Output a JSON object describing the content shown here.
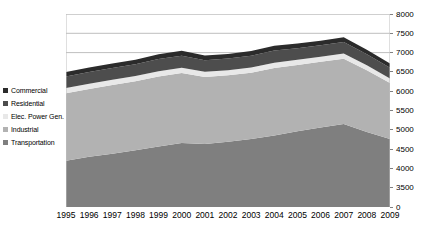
{
  "chart_data": {
    "type": "area",
    "stacked": true,
    "title": "",
    "xlabel": "",
    "ylabel": "",
    "grid": true,
    "legend_position": "left",
    "x": [
      "1995",
      "1996",
      "1997",
      "1998",
      "1999",
      "2000",
      "2001",
      "2002",
      "2003",
      "2004",
      "2005",
      "2006",
      "2007",
      "2008",
      "2009"
    ],
    "axis": {
      "y_tick_labels": [
        "8000",
        "7500",
        "7000",
        "6500",
        "6000",
        "5500",
        "5000",
        "4500",
        "4000",
        "3500",
        "0"
      ],
      "y_tick_values": [
        8000,
        7500,
        7000,
        6500,
        6000,
        5500,
        5000,
        4500,
        4000,
        3500,
        0
      ],
      "y_broken_axis": true,
      "y_min_display": 3200,
      "y_max_display": 8000,
      "gridline_values": [
        8000,
        7500,
        7000
      ]
    },
    "series": [
      {
        "name": "Transportation",
        "color": "#7f7f7f",
        "values": [
          4200,
          4300,
          4380,
          4470,
          4570,
          4660,
          4630,
          4690,
          4760,
          4850,
          4960,
          5060,
          5150,
          4940,
          4760
        ]
      },
      {
        "name": "Industrial",
        "color": "#b2b2b2",
        "values": [
          1750,
          1760,
          1780,
          1790,
          1810,
          1810,
          1740,
          1720,
          1720,
          1750,
          1720,
          1700,
          1690,
          1600,
          1450
        ]
      },
      {
        "name": "Elec. Power Gen.",
        "color": "#e8e8e8",
        "values": [
          130,
          130,
          135,
          135,
          140,
          140,
          135,
          135,
          135,
          140,
          135,
          135,
          135,
          130,
          120
        ]
      },
      {
        "name": "Residential",
        "color": "#4d4d4d",
        "values": [
          300,
          305,
          305,
          300,
          315,
          310,
          300,
          300,
          305,
          315,
          300,
          295,
          300,
          290,
          280
        ]
      },
      {
        "name": "Commercial",
        "color": "#2b2b2b",
        "values": [
          120,
          120,
          120,
          120,
          125,
          125,
          120,
          120,
          120,
          125,
          120,
          120,
          120,
          115,
          110
        ]
      }
    ],
    "legend": [
      {
        "label": "Commercial",
        "color": "#2b2b2b"
      },
      {
        "label": "Residential",
        "color": "#4d4d4d"
      },
      {
        "label": "Elec. Power Gen.",
        "color": "#e8e8e8"
      },
      {
        "label": "Industrial",
        "color": "#b2b2b2"
      },
      {
        "label": "Transportation",
        "color": "#7f7f7f"
      }
    ],
    "colors": {
      "plot_background": "#ffffff",
      "gridline": "#bfbfbf",
      "frame": "#bfbfbf",
      "axis_text": "#000000"
    }
  }
}
